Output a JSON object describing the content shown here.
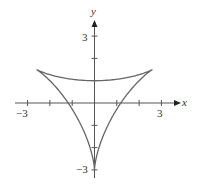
{
  "chart_data": {
    "type": "line",
    "title": "",
    "xlabel": "x",
    "ylabel": "y",
    "xlim": [
      -3.3,
      3.5
    ],
    "ylim": [
      -3.3,
      3.5
    ],
    "x_ticks": [
      -3,
      -2,
      -1,
      1,
      2,
      3
    ],
    "y_ticks": [
      -3,
      -2,
      -1,
      1,
      2,
      3
    ],
    "x_tick_labels": [
      {
        "value": -3,
        "label": "−3"
      },
      {
        "value": 3,
        "label": "3"
      }
    ],
    "y_tick_labels": [
      {
        "value": 3,
        "label": "3"
      },
      {
        "value": -3,
        "label": "−3"
      }
    ],
    "grid": false,
    "legend": null,
    "series": [
      {
        "name": "deltoid",
        "description": "Three-cusped hypocycloid (deltoid) with cusps at (0,-3), (-2.6,1.5), (2.6,1.5); top arc crosses y-axis at y=1; side arcs cross x-axis near x=±1.15",
        "parametric": "x = 2cos(t) + cos(2t), y = 2sin(t) - sin(2t), rotated so a cusp points to (0,-3)",
        "cusps": [
          [
            0,
            -3
          ],
          [
            -2.598,
            1.5
          ],
          [
            2.598,
            1.5
          ]
        ],
        "key_points": [
          [
            0,
            1
          ],
          [
            -1.15,
            0
          ],
          [
            1.15,
            0
          ]
        ],
        "color": "#666666"
      }
    ]
  },
  "axes": {
    "x_label": "x",
    "y_label": "y",
    "x_min_label": "−3",
    "x_max_label": "3",
    "y_max_label": "3",
    "y_min_label": "−3"
  },
  "style": {
    "axis_color": "#555555",
    "curve_color": "#6a6a6a"
  }
}
